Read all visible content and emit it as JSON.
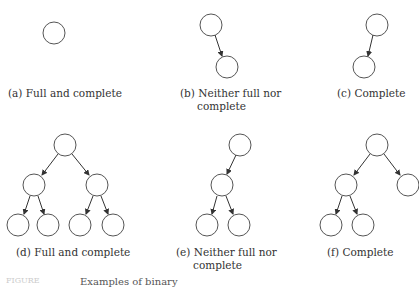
{
  "panels": [
    {
      "id": "a",
      "caption": "(a)  Full and complete"
    },
    {
      "id": "b",
      "caption_line1": "(b)  Neither full nor",
      "caption_line2": "complete"
    },
    {
      "id": "c",
      "caption": "(c)  Complete"
    },
    {
      "id": "d",
      "caption": "(d)  Full and complete"
    },
    {
      "id": "e",
      "caption_line1": "(e)  Neither full nor",
      "caption_line2": "complete"
    },
    {
      "id": "f",
      "caption": "(f)  Complete"
    }
  ],
  "bottom_caption": {
    "prefix": "FIGURE",
    "text": "Examples of binary"
  }
}
